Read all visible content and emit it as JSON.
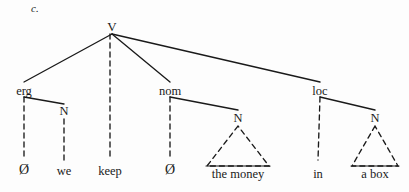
{
  "figure": {
    "letter": "c."
  },
  "tree": {
    "root": {
      "label": "V"
    },
    "roles": [
      {
        "name": "ergative",
        "label": "erg"
      },
      {
        "name": "nominative",
        "label": "nom"
      },
      {
        "name": "locative",
        "label": "loc"
      }
    ],
    "n_nodes": [
      {
        "name": "n-we",
        "label": "N"
      },
      {
        "name": "n-the-money",
        "label": "N"
      },
      {
        "name": "n-a-box",
        "label": "N"
      }
    ],
    "terminals": [
      {
        "name": "terminal-null-erg",
        "label": "Ø"
      },
      {
        "name": "terminal-we",
        "label": "we"
      },
      {
        "name": "terminal-keep",
        "label": "keep"
      },
      {
        "name": "terminal-null-nom",
        "label": "Ø"
      },
      {
        "name": "terminal-the-money",
        "label": "the money"
      },
      {
        "name": "terminal-in",
        "label": "in"
      },
      {
        "name": "terminal-a-box",
        "label": "a box"
      }
    ]
  },
  "style": {
    "ink": "#1a1a1a",
    "paper": "#fdfdfd"
  }
}
